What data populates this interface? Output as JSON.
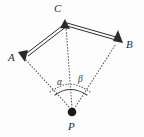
{
  "figure": {
    "type": "geometry-diagram",
    "background_color": "#fdfdfd",
    "stroke_color": "#2b2b2b",
    "dotted_color": "#555555",
    "points": [
      {
        "id": "C",
        "label": "C",
        "x": 65,
        "y": 22,
        "marker": "arrowhead-up"
      },
      {
        "id": "A",
        "label": "A",
        "x": 22,
        "y": 55,
        "marker": "arrowhead"
      },
      {
        "id": "B",
        "label": "B",
        "x": 118,
        "y": 38,
        "marker": "arrowhead"
      },
      {
        "id": "P",
        "label": "P",
        "x": 72,
        "y": 112,
        "marker": "filled-dot"
      }
    ],
    "vectors": [
      {
        "id": "CA",
        "from": "C",
        "to": "A",
        "style": "double-line-solid",
        "arrow_at": "A"
      },
      {
        "id": "CB",
        "from": "C",
        "to": "B",
        "style": "double-line-solid",
        "arrow_at": "B"
      }
    ],
    "sight_lines": [
      {
        "id": "PA",
        "from": "P",
        "to": "A",
        "style": "dotted"
      },
      {
        "id": "PC",
        "from": "P",
        "to": "C",
        "style": "dotted"
      },
      {
        "id": "PB",
        "from": "P",
        "to": "B",
        "style": "dotted"
      }
    ],
    "angles": [
      {
        "id": "alpha",
        "label": "α",
        "vertex": "P",
        "between": [
          "PA",
          "PC"
        ],
        "arc_style": "dotted",
        "label_x": 57,
        "label_y": 78
      },
      {
        "id": "beta",
        "label": "β",
        "vertex": "P",
        "between": [
          "PC",
          "PB"
        ],
        "arc_style": "dotted",
        "label_x": 78,
        "label_y": 75
      }
    ]
  }
}
